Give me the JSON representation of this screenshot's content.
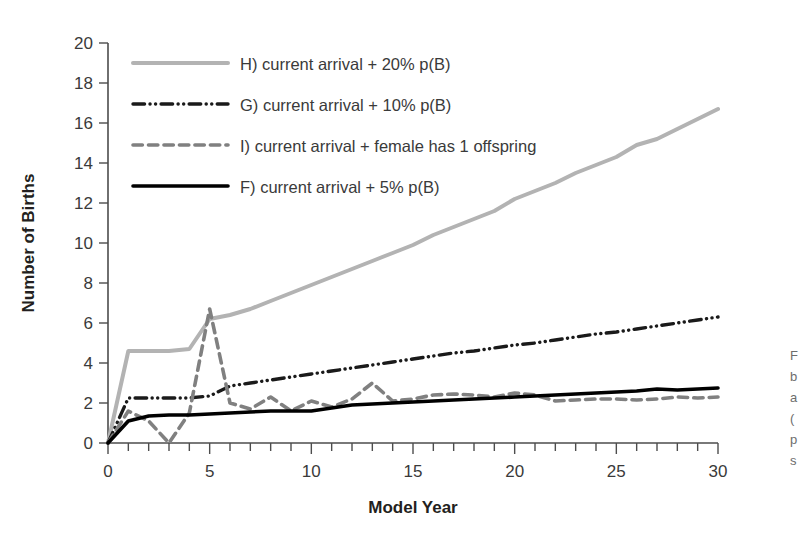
{
  "chart_data": {
    "type": "line",
    "title": "",
    "xlabel": "Model Year",
    "ylabel": "Number of Births",
    "xlim": [
      0,
      30
    ],
    "ylim": [
      0,
      20
    ],
    "xticks": [
      0,
      5,
      10,
      15,
      20,
      25,
      30
    ],
    "xtick_labels": [
      "0",
      "5",
      "10",
      "15",
      "20",
      "25",
      "30"
    ],
    "x_minor_tick_step": 1,
    "yticks": [
      0,
      2,
      4,
      6,
      8,
      10,
      12,
      14,
      16,
      18,
      20
    ],
    "ytick_labels": [
      "0",
      "2",
      "4",
      "6",
      "8",
      "10",
      "12",
      "14",
      "16",
      "18",
      "20"
    ],
    "grid": false,
    "legend_position": "top-left",
    "x": [
      0,
      1,
      2,
      3,
      4,
      5,
      6,
      7,
      8,
      9,
      10,
      11,
      12,
      13,
      14,
      15,
      16,
      17,
      18,
      19,
      20,
      21,
      22,
      23,
      24,
      25,
      26,
      27,
      28,
      29,
      30
    ],
    "series": [
      {
        "name": "H",
        "label": "H) current arrival + 20% p(B)",
        "color": "#b3b3b3",
        "style": "solid",
        "width": 4.0,
        "values": [
          0,
          4.6,
          4.6,
          4.6,
          4.7,
          6.2,
          6.4,
          6.7,
          7.1,
          7.5,
          7.9,
          8.3,
          8.7,
          9.1,
          9.5,
          9.9,
          10.4,
          10.8,
          11.2,
          11.6,
          12.2,
          12.6,
          13.0,
          13.5,
          13.9,
          14.3,
          14.9,
          15.2,
          15.7,
          16.2,
          16.7
        ]
      },
      {
        "name": "G",
        "label": "G) current arrival + 10% p(B)",
        "color": "#1a1a1a",
        "style": "dash-dot-dot",
        "width": 3.4,
        "values": [
          0,
          2.25,
          2.25,
          2.25,
          2.25,
          2.35,
          2.85,
          3.0,
          3.15,
          3.3,
          3.45,
          3.6,
          3.75,
          3.9,
          4.05,
          4.2,
          4.35,
          4.5,
          4.6,
          4.75,
          4.9,
          5.0,
          5.15,
          5.3,
          5.45,
          5.55,
          5.7,
          5.85,
          6.0,
          6.15,
          6.3
        ]
      },
      {
        "name": "I",
        "label": "I) current arrival + female has 1 offspring",
        "color": "#808080",
        "style": "dashed",
        "width": 3.6,
        "values": [
          0,
          1.6,
          1.1,
          0.0,
          1.5,
          6.7,
          2.0,
          1.7,
          2.3,
          1.6,
          2.1,
          1.8,
          2.2,
          3.0,
          2.1,
          2.2,
          2.4,
          2.45,
          2.4,
          2.3,
          2.5,
          2.4,
          2.1,
          2.15,
          2.2,
          2.2,
          2.15,
          2.2,
          2.3,
          2.25,
          2.3
        ]
      },
      {
        "name": "F",
        "label": "F) current arrival + 5% p(B)",
        "color": "#000000",
        "style": "solid",
        "width": 3.6,
        "values": [
          0,
          1.1,
          1.35,
          1.4,
          1.4,
          1.45,
          1.5,
          1.55,
          1.6,
          1.6,
          1.6,
          1.75,
          1.9,
          1.95,
          2.0,
          2.05,
          2.1,
          2.15,
          2.2,
          2.25,
          2.3,
          2.35,
          2.4,
          2.45,
          2.5,
          2.55,
          2.6,
          2.7,
          2.65,
          2.7,
          2.75
        ]
      }
    ]
  },
  "legend": {
    "entries": [
      {
        "label": "H) current arrival + 20% p(B)",
        "series": "H"
      },
      {
        "label": "G) current arrival + 10% p(B)",
        "series": "G"
      },
      {
        "label": "I) current arrival + female has 1 offspring",
        "series": "I"
      },
      {
        "label": "F) current arrival + 5% p(B)",
        "series": "F"
      }
    ]
  },
  "caption_fragment": {
    "lines": [
      "F",
      "b",
      "a",
      "(",
      "p",
      "s"
    ]
  }
}
